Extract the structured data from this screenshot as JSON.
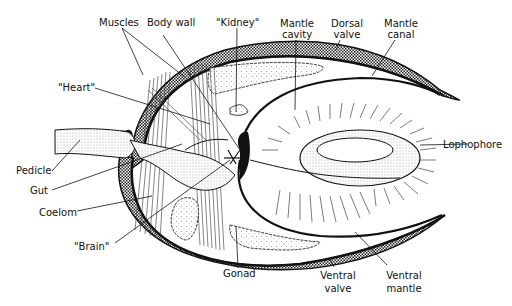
{
  "figure": {
    "colors": {
      "ink": "#111111",
      "background": "#ffffff",
      "shell_fill": "#555555"
    }
  },
  "labels": {
    "muscles": "Muscles",
    "body_wall": "Body wall",
    "kidney": "\"Kidney\"",
    "mantle_cavity_1": "Mantle",
    "mantle_cavity_2": "cavity",
    "dorsal_valve_1": "Dorsal",
    "dorsal_valve_2": "valve",
    "mantle_canal_1": "Mantle",
    "mantle_canal_2": "canal",
    "heart": "\"Heart\"",
    "lophophore": "Lophophore",
    "pedicle": "Pedicle",
    "gut": "Gut",
    "coelom": "Coelom",
    "brain": "\"Brain\"",
    "gonad": "Gonad",
    "ventral_valve_1": "Ventral",
    "ventral_valve_2": "valve",
    "ventral_mantle_1": "Ventral",
    "ventral_mantle_2": "mantle"
  }
}
